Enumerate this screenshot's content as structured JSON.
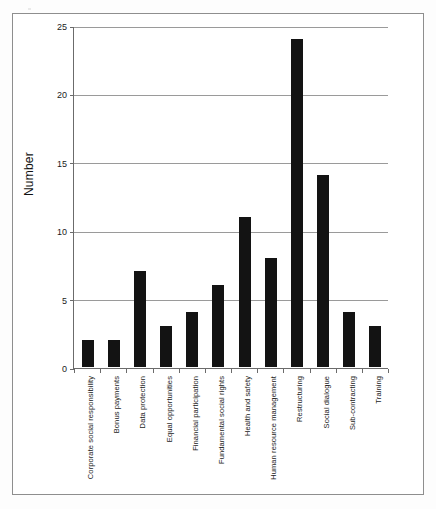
{
  "chart_data": {
    "type": "bar",
    "title": "",
    "xlabel": "",
    "ylabel": "Number",
    "ylim": [
      0,
      25
    ],
    "yticks": [
      0,
      5,
      10,
      15,
      20,
      25
    ],
    "ytick_labels": [
      "0",
      "5",
      "10",
      "15",
      "20",
      "25"
    ],
    "grid": true,
    "legend": false,
    "bar_color": "#131313",
    "categories": [
      "Corporate social responsibility",
      "Bonus payments",
      "Data protection",
      "Equal opportunities",
      "Financial participation",
      "Fundamental social rights",
      "Health and safety",
      "Human resource management",
      "Restructuring",
      "Social dialogue",
      "Sub-contracting",
      "Training"
    ],
    "values": [
      2,
      2,
      7,
      3,
      4,
      6,
      11,
      8,
      24,
      14,
      4,
      3
    ]
  },
  "colors": {
    "frame": "#8e8e8e",
    "axis": "#6b6b6b",
    "gridline": "#9a9a9a",
    "bar": "#131313",
    "background": "#ffffff"
  }
}
